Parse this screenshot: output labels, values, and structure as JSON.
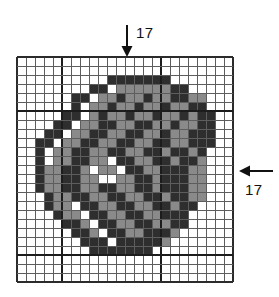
{
  "figure": {
    "name": "pixelated-glyph-grid-figure",
    "background_color": "#ffffff"
  },
  "grid": {
    "columns": 24,
    "rows": 25,
    "cell_size_px": 9,
    "origin_x_px": 17,
    "origin_y_px": 57,
    "line_color": "#5d5d5d",
    "major_line_color": "#1c1c1c",
    "border_color": "#2b2b2b",
    "major_column_lines": [
      5,
      16
    ],
    "major_row_lines": [
      6,
      22
    ],
    "palette": {
      "empty": "#ffffff",
      "mid": "#8a8a8a",
      "dark": "#2e2e2e"
    },
    "legend": [
      {
        "key": "0",
        "name": "empty",
        "color": "#ffffff"
      },
      {
        "key": "1",
        "name": "mid-gray",
        "color": "#8a8a8a"
      },
      {
        "key": "2",
        "name": "dark",
        "color": "#2e2e2e"
      }
    ],
    "rows_data": [
      "000000000000000000000000",
      "000000000000000000000000",
      "000000000022222220000000",
      "000000002201111112200000",
      "000000220112112112211000",
      "000000201121121121122000",
      "000002201211211211212200",
      "000022011221122112112200",
      "000220112211221121122200",
      "002201122112211221122200",
      "002011221122112212212000",
      "002011221102211221221000",
      "002112210110221122211000",
      "002112211001122122211000",
      "002112211221122122211000",
      "000211221122112212211000",
      "000211022112211221220000",
      "000021102211221122200000",
      "000002210221122112200000",
      "000000221022112221000000",
      "000000022202222210000000",
      "000000002222222000000000",
      "000000000000000000000000",
      "000000000000000000000000",
      "000000000000000000000000"
    ]
  },
  "annotations": {
    "top": {
      "label": "17",
      "arrow_direction": "down",
      "name": "top-dimension-arrow"
    },
    "right": {
      "label": "17",
      "arrow_direction": "left",
      "name": "right-dimension-arrow"
    }
  }
}
